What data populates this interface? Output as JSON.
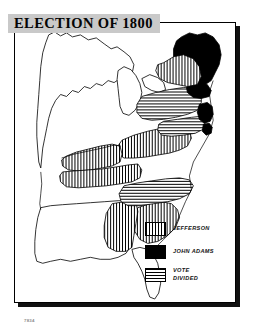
{
  "title": {
    "text": "ELECTION OF 1800",
    "banner_color": "#c9c9c9"
  },
  "credit": {
    "text": "7834"
  },
  "legend": {
    "items": [
      {
        "label": "JEFFERSON",
        "pattern": "vertical-stripes",
        "swatch_name": "legend-swatch-jefferson"
      },
      {
        "label": "JOHN ADAMS",
        "pattern": "solid-black",
        "swatch_name": "legend-swatch-john-adams"
      },
      {
        "label": "VOTE\nDIVIDED",
        "pattern": "horizontal-stripes",
        "swatch_name": "legend-swatch-vote-divided"
      }
    ]
  },
  "map": {
    "type": "choropleth-historical-election",
    "region": "Eastern United States",
    "year": 1800,
    "colors": {
      "outline": "#000000",
      "background": "#ffffff",
      "adams": "#000000"
    },
    "patterns": {
      "jefferson": "vertical-stripes",
      "john_adams": "solid-black",
      "vote_divided": "horizontal-stripes",
      "unshaded": "outline-only"
    },
    "regions": [
      {
        "name": "New England (Maine / Massachusetts / New Hampshire)",
        "result": "john_adams"
      },
      {
        "name": "Connecticut / Rhode Island",
        "result": "john_adams"
      },
      {
        "name": "Vermont",
        "result": "john_adams"
      },
      {
        "name": "New York",
        "result": "vote_divided"
      },
      {
        "name": "Pennsylvania",
        "result": "vote_divided"
      },
      {
        "name": "New Jersey",
        "result": "john_adams"
      },
      {
        "name": "Delaware",
        "result": "john_adams"
      },
      {
        "name": "Maryland",
        "result": "vote_divided"
      },
      {
        "name": "Virginia",
        "result": "jefferson"
      },
      {
        "name": "Kentucky",
        "result": "jefferson"
      },
      {
        "name": "Tennessee",
        "result": "jefferson"
      },
      {
        "name": "North Carolina",
        "result": "vote_divided"
      },
      {
        "name": "South Carolina",
        "result": "jefferson"
      },
      {
        "name": "Georgia",
        "result": "jefferson"
      },
      {
        "name": "Northwest Territory",
        "result": "unshaded"
      },
      {
        "name": "Indiana Territory",
        "result": "unshaded"
      },
      {
        "name": "Mississippi Territory",
        "result": "unshaded"
      },
      {
        "name": "Spanish Florida",
        "result": "unshaded"
      }
    ]
  }
}
